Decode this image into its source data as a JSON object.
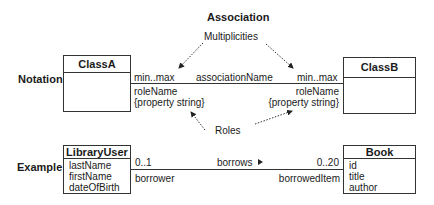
{
  "labels": {
    "association_title": "Association",
    "multiplicities": "Multiplicities",
    "roles": "Roles",
    "notation": "Notation",
    "example": "Example"
  },
  "notation": {
    "class_a": {
      "name": "ClassA"
    },
    "class_b": {
      "name": "ClassB"
    },
    "association_name": "associationName",
    "left_end": {
      "multiplicity": "min..max",
      "role_name": "roleName",
      "property": "{property string}"
    },
    "right_end": {
      "multiplicity": "min..max",
      "role_name": "roleName",
      "property": "{property string}"
    }
  },
  "example": {
    "class_left": {
      "name": "LibraryUser",
      "attributes": [
        "lastName",
        "firstName",
        "dateOfBirth"
      ]
    },
    "class_right": {
      "name": "Book",
      "attributes": [
        "id",
        "title",
        "author"
      ]
    },
    "association_name": "borrows",
    "direction_icon": "triangle-right",
    "left_end": {
      "multiplicity": "0..1",
      "role_name": "borrower"
    },
    "right_end": {
      "multiplicity": "0..20",
      "role_name": "borrowedItem"
    }
  }
}
